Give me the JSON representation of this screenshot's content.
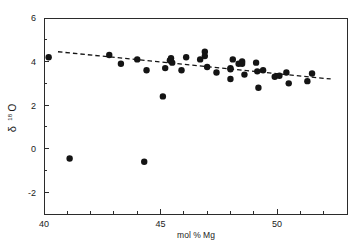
{
  "chart_data": {
    "type": "scatter",
    "title": "",
    "xlabel": "mol % Mg",
    "ylabel": "δ 18O",
    "ylabel_symbol": "δ",
    "ylabel_superscript": "18",
    "ylabel_element": "O",
    "xlim": [
      40,
      53
    ],
    "ylim": [
      -3,
      6
    ],
    "xticks": [
      40,
      45,
      50
    ],
    "xtick_labels": [
      "40",
      "45",
      "50"
    ],
    "xminor_ticks": [
      41,
      42,
      43,
      44,
      46,
      47,
      48,
      49,
      51,
      52,
      53
    ],
    "yticks": [
      -2,
      0,
      2,
      4,
      6
    ],
    "ytick_labels": [
      "-2",
      "0",
      "2",
      "4",
      "6"
    ],
    "yminor_ticks": [
      -3,
      -1,
      1,
      3,
      5
    ],
    "grid": false,
    "legend": null,
    "marker": "filled-circle",
    "marker_color": "#141414",
    "marker_size_px": 3.2,
    "points": [
      {
        "x": 40.2,
        "y": 4.2
      },
      {
        "x": 41.1,
        "y": -0.45
      },
      {
        "x": 42.8,
        "y": 4.3
      },
      {
        "x": 43.3,
        "y": 3.9
      },
      {
        "x": 44.0,
        "y": 4.1
      },
      {
        "x": 44.3,
        "y": -0.6
      },
      {
        "x": 44.4,
        "y": 3.6
      },
      {
        "x": 45.1,
        "y": 2.4
      },
      {
        "x": 45.2,
        "y": 3.7
      },
      {
        "x": 45.4,
        "y": 4.05
      },
      {
        "x": 45.45,
        "y": 4.15
      },
      {
        "x": 45.5,
        "y": 3.95
      },
      {
        "x": 45.9,
        "y": 3.6
      },
      {
        "x": 46.1,
        "y": 4.2
      },
      {
        "x": 46.7,
        "y": 4.1
      },
      {
        "x": 46.9,
        "y": 4.45
      },
      {
        "x": 46.9,
        "y": 4.25
      },
      {
        "x": 47.0,
        "y": 3.75
      },
      {
        "x": 47.4,
        "y": 3.5
      },
      {
        "x": 48.0,
        "y": 3.7
      },
      {
        "x": 48.0,
        "y": 3.65
      },
      {
        "x": 48.0,
        "y": 3.2
      },
      {
        "x": 48.1,
        "y": 4.1
      },
      {
        "x": 48.35,
        "y": 3.9
      },
      {
        "x": 48.5,
        "y": 4.0
      },
      {
        "x": 48.5,
        "y": 3.9
      },
      {
        "x": 48.6,
        "y": 3.4
      },
      {
        "x": 49.1,
        "y": 3.95
      },
      {
        "x": 49.15,
        "y": 3.55
      },
      {
        "x": 49.2,
        "y": 2.8
      },
      {
        "x": 49.4,
        "y": 3.6
      },
      {
        "x": 49.9,
        "y": 3.3
      },
      {
        "x": 50.1,
        "y": 3.35
      },
      {
        "x": 50.4,
        "y": 3.5
      },
      {
        "x": 50.5,
        "y": 3.0
      },
      {
        "x": 51.3,
        "y": 3.1
      },
      {
        "x": 51.5,
        "y": 3.45
      }
    ],
    "trend": {
      "x_start": 40.6,
      "y_start": 4.45,
      "x_end": 52.3,
      "y_end": 3.2,
      "style": "dashed"
    }
  }
}
